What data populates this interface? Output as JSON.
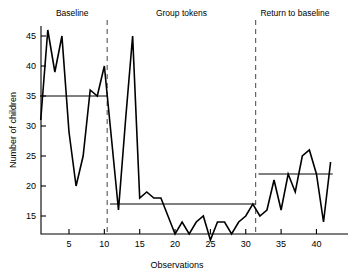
{
  "chart_data": {
    "type": "line",
    "title": "",
    "xlabel": "Observations",
    "ylabel": "Number of children",
    "xlim": [
      0.5,
      42.5
    ],
    "ylim": [
      11,
      47
    ],
    "grid": false,
    "legend_position": "none",
    "x_ticks": [
      5,
      10,
      15,
      20,
      25,
      30,
      35,
      40
    ],
    "y_ticks": [
      15,
      20,
      25,
      30,
      35,
      40,
      45
    ],
    "x": [
      1,
      2,
      3,
      4,
      5,
      6,
      7,
      8,
      9,
      10,
      11,
      12,
      13,
      14,
      15,
      16,
      17,
      18,
      19,
      20,
      21,
      22,
      23,
      24,
      25,
      26,
      27,
      28,
      29,
      30,
      31,
      32,
      33,
      34,
      35,
      36,
      37,
      38,
      39,
      40,
      41,
      42
    ],
    "values": [
      31,
      46,
      39,
      45,
      29,
      20,
      25,
      36,
      35,
      40,
      28,
      16,
      31,
      45,
      18,
      19,
      18,
      18,
      15,
      12,
      14,
      12,
      14,
      15,
      11,
      14,
      14,
      12,
      14,
      15,
      17,
      15,
      16,
      21,
      16,
      22,
      19,
      25,
      26,
      22,
      14,
      24
    ],
    "series": [
      {
        "name": "Number of children",
        "values": [
          31,
          46,
          39,
          45,
          29,
          20,
          25,
          36,
          35,
          40,
          28,
          16,
          31,
          45,
          18,
          19,
          18,
          18,
          15,
          12,
          14,
          12,
          14,
          15,
          11,
          14,
          14,
          12,
          14,
          15,
          17,
          15,
          16,
          21,
          16,
          22,
          19,
          25,
          26,
          22,
          14,
          24
        ]
      }
    ],
    "phases": [
      {
        "label": "Baseline",
        "x_start": 0.5,
        "x_end": 10.4,
        "mean_level": 35,
        "mean_line_x_start": 0.9,
        "mean_line_x_end": 10.4
      },
      {
        "label": "Group tokens",
        "x_start": 10.4,
        "x_end": 31.4,
        "mean_level": 17,
        "mean_line_x_start": 10.8,
        "mean_line_x_end": 31.4
      },
      {
        "label": "Return to baseline",
        "x_start": 31.4,
        "x_end": 42.5,
        "mean_level": 22,
        "mean_line_x_start": 31.8,
        "mean_line_x_end": 42.3
      }
    ],
    "phase_dividers": [
      10.4,
      31.4
    ],
    "annotations": []
  },
  "style": {
    "line_color": "#000000",
    "axis_color": "#000000",
    "mean_line_color": "#000000",
    "divider_color": "#555555",
    "background": "#ffffff"
  }
}
